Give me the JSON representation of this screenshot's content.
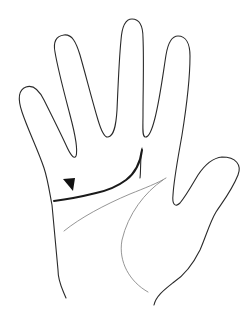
{
  "figure": {
    "annotations": [
      {
        "type": "arrowhead-marker",
        "target": "single transverse palmar crease",
        "direction": "pointing down-right"
      }
    ],
    "lines": [
      {
        "name": "transverse-crease",
        "style": "bold"
      },
      {
        "name": "proximal-transverse-crease",
        "style": "thin"
      },
      {
        "name": "thenar-crease",
        "style": "thin"
      }
    ],
    "colors": {
      "outline": "#2a2a2a",
      "bold_crease": "#1a1a1a",
      "thin_crease": "#8a8a8a",
      "background": "#ffffff"
    }
  }
}
